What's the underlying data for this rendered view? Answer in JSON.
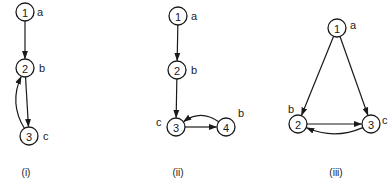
{
  "diagrams": [
    {
      "caption": "(i)",
      "caption_pos": [
        26,
        176
      ],
      "nodes": [
        {
          "id": "1",
          "label": "1",
          "tag": "a",
          "x": 25,
          "y": 12,
          "tag_dx": 12,
          "tag_dy": 0
        },
        {
          "id": "2",
          "label": "2",
          "tag": "b",
          "x": 25,
          "y": 68,
          "tag_dx": 14,
          "tag_dy": 0
        },
        {
          "id": "3",
          "label": "3",
          "tag": "c",
          "x": 29,
          "y": 136,
          "tag_dx": 14,
          "tag_dy": 0
        }
      ],
      "edges": [
        {
          "from": "1",
          "to": "2",
          "type": "straight"
        },
        {
          "from": "2",
          "to": "3",
          "type": "straight"
        },
        {
          "from": "3",
          "to": "2",
          "type": "curve",
          "curve": "left"
        }
      ]
    },
    {
      "caption": "(ii)",
      "caption_pos": [
        178,
        176
      ],
      "nodes": [
        {
          "id": "1",
          "label": "1",
          "tag": "a",
          "x": 178,
          "y": 16,
          "tag_dx": 13,
          "tag_dy": 0
        },
        {
          "id": "2",
          "label": "2",
          "tag": "b",
          "x": 177,
          "y": 70,
          "tag_dx": 14,
          "tag_dy": 0
        },
        {
          "id": "3",
          "label": "3",
          "tag": "c",
          "x": 176,
          "y": 127,
          "tag_dx": -20,
          "tag_dy": -5
        },
        {
          "id": "4",
          "label": "4",
          "tag": "b",
          "x": 226,
          "y": 127,
          "tag_dx": 12,
          "tag_dy": -14
        }
      ],
      "edges": [
        {
          "from": "1",
          "to": "2",
          "type": "straight"
        },
        {
          "from": "2",
          "to": "3",
          "type": "straight"
        },
        {
          "from": "3",
          "to": "4",
          "type": "straight"
        },
        {
          "from": "4",
          "to": "3",
          "type": "curve",
          "curve": "above"
        }
      ]
    },
    {
      "caption": "(iii)",
      "caption_pos": [
        336,
        176
      ],
      "nodes": [
        {
          "id": "1",
          "label": "1",
          "tag": "a",
          "x": 337,
          "y": 28,
          "tag_dx": 13,
          "tag_dy": -3
        },
        {
          "id": "2",
          "label": "2",
          "tag": "b",
          "x": 298,
          "y": 124,
          "tag_dx": -10,
          "tag_dy": -15
        },
        {
          "id": "3",
          "label": "3",
          "tag": "c",
          "x": 371,
          "y": 124,
          "tag_dx": 11,
          "tag_dy": -4
        }
      ],
      "edges": [
        {
          "from": "1",
          "to": "2",
          "type": "straight"
        },
        {
          "from": "1",
          "to": "3",
          "type": "straight"
        },
        {
          "from": "2",
          "to": "3",
          "type": "straight"
        },
        {
          "from": "3",
          "to": "2",
          "type": "curve",
          "curve": "below"
        }
      ]
    }
  ],
  "style": {
    "stroke": "#1a1a1a",
    "background": "#ffffff",
    "node_radius": 9
  }
}
